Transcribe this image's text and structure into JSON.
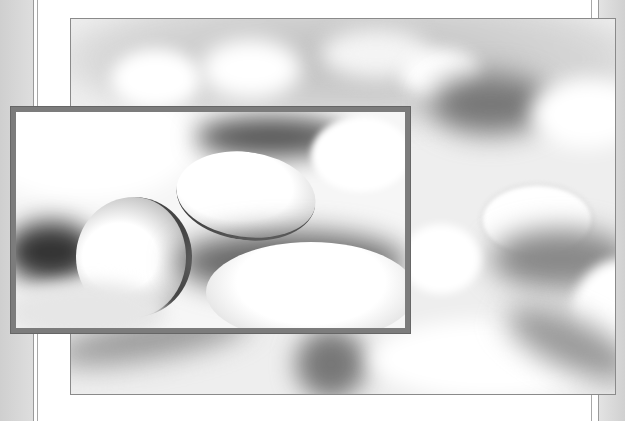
{
  "image": {
    "description": "Layered photo composition of white oval pills on a white surface, grayscale",
    "layers": [
      {
        "name": "back-photo",
        "subject": "blurred white pills with soft shadows"
      },
      {
        "name": "front-photo",
        "subject": "close-up of white oval pills with strong shadows"
      }
    ],
    "colors": {
      "margin": "#d4d4d4",
      "page": "#ffffff",
      "frame": "#7c7c7c",
      "shadow": "#5a5a5a"
    }
  }
}
